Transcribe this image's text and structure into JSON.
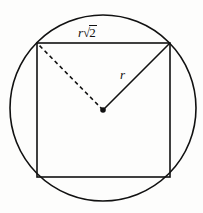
{
  "figure": {
    "background_color": "#fdfdfc",
    "stroke_color": "#111111",
    "labels": {
      "side": {
        "variable": "r",
        "radical_sign": "√",
        "radical_argument": "2",
        "full_text": "r√2"
      },
      "radius": {
        "text": "r"
      }
    },
    "shapes": {
      "circle": {
        "name": "circumscribed-circle",
        "center_x": 103,
        "center_y": 108,
        "radius": 93
      },
      "square": {
        "name": "inscribed-square",
        "top_left_x": 37,
        "top_left_y": 43,
        "side": 133
      },
      "radius_line": {
        "name": "radius-to-top-right-corner",
        "style": "solid",
        "x1": 103,
        "y1": 110,
        "x2": 170,
        "y2": 43
      },
      "dashed_line": {
        "name": "radius-to-top-left-corner",
        "style": "dashed",
        "x1": 103,
        "y1": 110,
        "x2": 37,
        "y2": 43
      },
      "center_dot": {
        "name": "circle-center-point",
        "cx": 103,
        "cy": 110,
        "r": 2.6
      }
    }
  }
}
